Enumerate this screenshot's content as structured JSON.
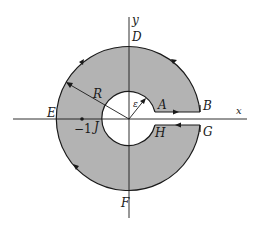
{
  "figure": {
    "colors": {
      "fill": "#b3b3b3",
      "stroke": "#1a1a1a",
      "background": "#ffffff"
    },
    "axes": {
      "x_label": "x",
      "y_label": "y"
    },
    "labels": {
      "A": "A",
      "B": "B",
      "D": "D",
      "E": "E",
      "F": "F",
      "G": "G",
      "H": "H",
      "J": "J",
      "R": "R",
      "epsilon": "ε",
      "minus_one": "−1"
    },
    "geometry": {
      "outer_radius_label": "R",
      "inner_radius_label": "ε",
      "marked_point": "-1"
    }
  }
}
